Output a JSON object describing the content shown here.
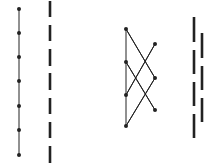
{
  "colors": {
    "background": "#ffffff",
    "stroke": "#222222"
  },
  "figures": [
    {
      "name": "chain-poset",
      "x": 19,
      "node_y": [
        9,
        33,
        57,
        81,
        106,
        130,
        155
      ]
    },
    {
      "name": "chain-dashes",
      "x": 50,
      "segments": [
        [
          1,
          17
        ],
        [
          25,
          41
        ],
        [
          49,
          66
        ],
        [
          73,
          90
        ],
        [
          98,
          114
        ],
        [
          122,
          138
        ],
        [
          146,
          163
        ]
      ]
    },
    {
      "name": "crown-poset",
      "left_x": 126,
      "right_x": 155,
      "left_nodes_y": [
        29,
        62,
        95,
        126
      ],
      "right_nodes_y": [
        44,
        78,
        110
      ],
      "edges": [
        [
          0,
          1
        ],
        [
          0,
          2
        ],
        [
          1,
          0
        ],
        [
          1,
          2
        ],
        [
          2,
          0
        ],
        [
          3,
          1
        ]
      ]
    },
    {
      "name": "interleaved-dashes",
      "left_x": 194,
      "right_x": 202,
      "left_segments": [
        [
          17,
          42
        ],
        [
          50,
          74
        ],
        [
          82,
          106
        ],
        [
          114,
          138
        ]
      ],
      "right_segments": [
        [
          33,
          58
        ],
        [
          66,
          90
        ],
        [
          98,
          122
        ]
      ]
    }
  ]
}
